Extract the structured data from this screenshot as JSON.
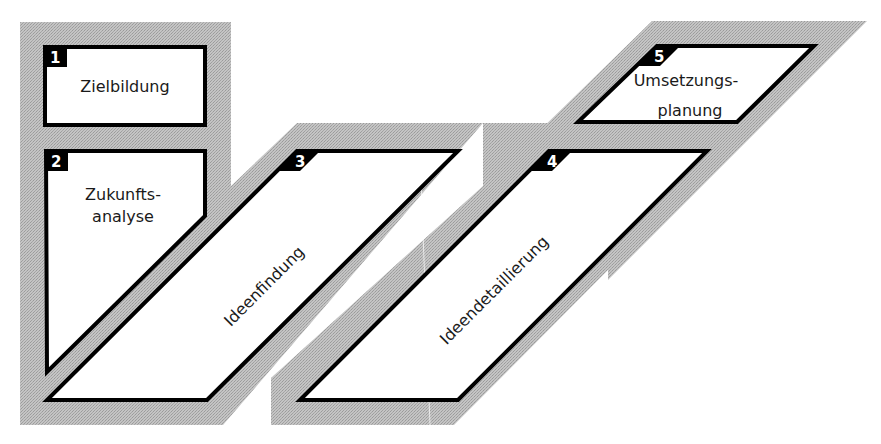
{
  "diagram": {
    "type": "process-flow",
    "colors": {
      "background_band": "#b9b9b9",
      "box_fill": "#ffffff",
      "box_border": "#000000",
      "number_tab": "#000000",
      "number_text": "#ffffff",
      "label_text": "#1a1a1a"
    },
    "steps": [
      {
        "number": "1",
        "label_line1": "Zielbildung",
        "label_line2": ""
      },
      {
        "number": "2",
        "label_line1": "Zukunfts-",
        "label_line2": "analyse"
      },
      {
        "number": "3",
        "label_line1": "Ideenfindung",
        "label_line2": ""
      },
      {
        "number": "4",
        "label_line1": "Ideendetaillierung",
        "label_line2": ""
      },
      {
        "number": "5",
        "label_line1": "Umsetzungs-",
        "label_line2": "planung"
      }
    ]
  }
}
